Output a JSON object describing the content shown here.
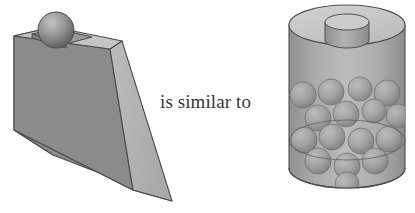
{
  "scene": {
    "title": "is similar to",
    "relation_label": "is similar to",
    "background_color": "#ffffff",
    "text_color": "#363636"
  },
  "caption": {
    "text": "is similar to"
  },
  "left_object": {
    "name": "wedge-with-sphere",
    "shape": "triangular wedge (ramp)",
    "sphere_count": 1,
    "sphere_position": "recessed square socket on top of the tall end",
    "colors": {
      "left_face": "#818181",
      "slope_face": "#b4b4b4",
      "top_face": "#c4c4c4",
      "front_face": "#9a9a9a",
      "socket_floor": "#8d8d8d",
      "sphere_light": "#b9b9b9",
      "sphere_dark": "#6d6d6d",
      "outline": "#4a4a4a"
    }
  },
  "right_object": {
    "name": "cylinder-with-spheres",
    "shape": "translucent cylinder with cylindrical knob on top",
    "sphere_count": 16,
    "knob": "small cylinder centred on the top face",
    "fill_line": "internal ellipse showing sphere level",
    "colors": {
      "body": "#a6a6a6",
      "body_highlight": "#c2c2c2",
      "top_face": "#c6c6c6",
      "knob_top": "#c9c9c9",
      "knob_side": "#9e9e9e",
      "sphere_light": "#b6b6b6",
      "sphere_dark": "#8a8a8a",
      "outline": "#4f4f4f"
    }
  }
}
